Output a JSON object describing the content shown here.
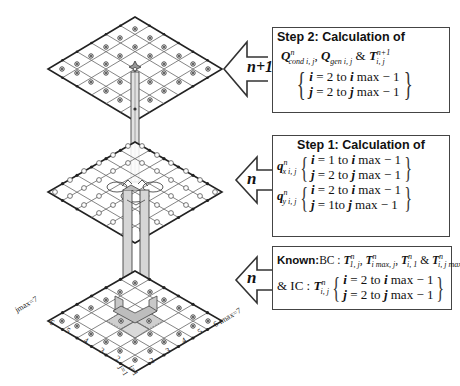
{
  "layers": [
    {
      "id": "top",
      "time_level_label": "n+1"
    },
    {
      "id": "middle",
      "time_level_label": "n"
    },
    {
      "id": "bottom",
      "time_level_label": "n"
    }
  ],
  "step2_box": {
    "title": "Step 2: Calculation of",
    "quantities": "Q^n_cond i,j , Q_gen i,j & T^(n+1)_i,j",
    "q1": "Q",
    "q1_sup": "n",
    "q1_sub": "cond i, j",
    "q2": "Q",
    "q2_sub": "gen i, j",
    "amp": "&",
    "t": "T",
    "t_sup": "n+1",
    "t_sub": "i, j",
    "range_i": {
      "var": "i",
      "text": " = 2  to  ",
      "var2": "i",
      "end": " max − 1"
    },
    "range_j": {
      "var": "j",
      "text": " = 2 to ",
      "var2": "j",
      "end": " max − 1"
    }
  },
  "step1_box": {
    "title": "Step 1: Calculation of",
    "qx": {
      "sym": "q",
      "sup": "n",
      "sub": "x i, j",
      "range_i": {
        "var": "i",
        "text": " = 1 to ",
        "var2": "i",
        "end": " max − 1"
      },
      "range_j": {
        "var": "j",
        "text": " = 2 to  ",
        "var2": "j",
        "end": " max − 1"
      }
    },
    "qy": {
      "sym": "q",
      "sup": "n",
      "sub": "y i, j",
      "range_i": {
        "var": "i",
        "text": " = 2 to ",
        "var2": "i",
        "end": " max − 1"
      },
      "range_j": {
        "var": "j",
        "text": " = 1to  ",
        "var2": "j",
        "end": " max − 1"
      }
    }
  },
  "known_box": {
    "known_label": "Known:",
    "bc_label": "BC : ",
    "bc_terms": [
      "T^n_1,j",
      "T^n_imax,j",
      "T^n_i,1",
      "T^n_i,jmax"
    ],
    "t": "T",
    "sup": "n",
    "sub1": "1, j",
    "sub2": "i max, j",
    "sub3": "i, 1",
    "sub4": "i, j max",
    "comma": ", ",
    "amp": " & ",
    "ic_label": "& IC : ",
    "ic_sub": "i, j",
    "range_i": {
      "var": "i",
      "text": " = 2 to ",
      "var2": "i",
      "end": " max − 1"
    },
    "range_j": {
      "var": "j",
      "text": " = 2 to ",
      "var2": "j",
      "end": " max − 1"
    }
  },
  "axes": {
    "j_max_label": "jmax=7",
    "i_max_label": "6 imax=7",
    "j_ticks": [
      "6",
      "5",
      "4",
      "3",
      "2"
    ],
    "i_ticks": [
      "2",
      "3",
      "4",
      "5"
    ],
    "j_start": "j=1",
    "i_start": "i=1"
  },
  "colors": {
    "line": "#333333",
    "grid": "#555555",
    "highlight": "#bbbbbb",
    "column": "#d0d0d0"
  }
}
